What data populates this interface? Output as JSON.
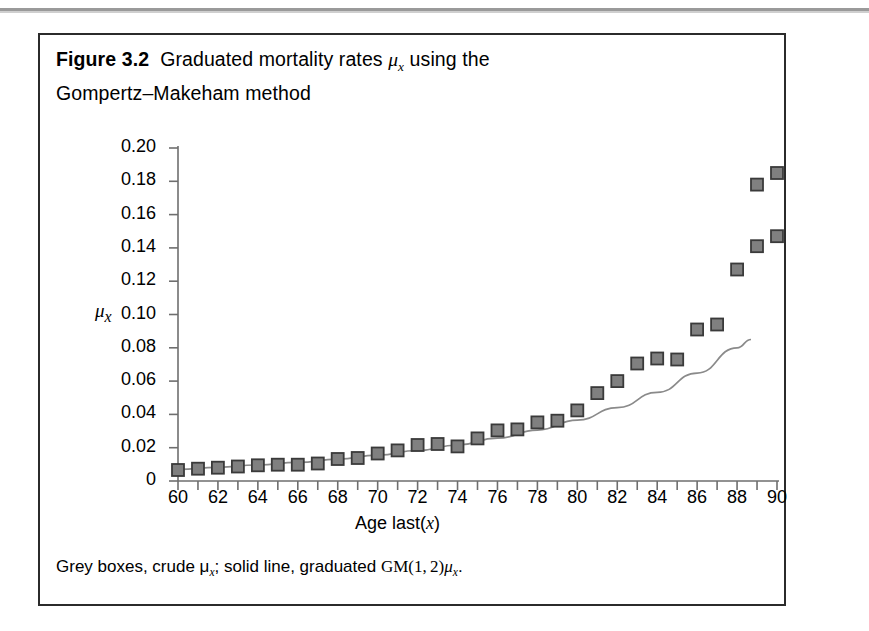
{
  "figure": {
    "number": "Figure 3.2",
    "title_line1": "Graduated mortality rates μ",
    "title_sub1": "x",
    "title_line1_tail": " using the",
    "title_line2": "Gompertz–Makeham method",
    "caption_pre": "Grey boxes, crude μ",
    "caption_sub1": "x",
    "caption_mid": "; solid line, graduated GM(1, 2)μ",
    "caption_sub2": "x",
    "caption_end": "."
  },
  "axes": {
    "ylabel": "μ",
    "ylabel_sub": "x",
    "xlabel_pre": "Age last(",
    "xlabel_var": "x",
    "xlabel_post": ")"
  },
  "colors": {
    "marker_fill": "#808080",
    "marker_edge": "#3a3a3a",
    "line": "#8a8a8a",
    "axis": "#6e6e6e",
    "frame": "#2b2b2b",
    "text": "#000000"
  },
  "chart_data": {
    "type": "scatter",
    "title": "Graduated mortality rates μx using the Gompertz–Makeham method",
    "xlabel": "Age last(x)",
    "ylabel": "μx",
    "xlim": [
      60,
      90
    ],
    "ylim": [
      0,
      0.2
    ],
    "xticks": [
      60,
      62,
      64,
      66,
      68,
      70,
      72,
      74,
      76,
      78,
      80,
      82,
      84,
      86,
      88,
      90
    ],
    "xtick_labels": [
      "60",
      "62",
      "64",
      "66",
      "68",
      "70",
      "72",
      "74",
      "76",
      "78",
      "80",
      "82",
      "84",
      "86",
      "88",
      "90"
    ],
    "xtick_minor_step": 1,
    "yticks": [
      0,
      0.02,
      0.04,
      0.06,
      0.08,
      0.1,
      0.12,
      0.14,
      0.16,
      0.18,
      0.2
    ],
    "ytick_labels": [
      "0",
      "0.02",
      "0.04",
      "0.06",
      "0.08",
      "0.10",
      "0.12",
      "0.14",
      "0.16",
      "0.18",
      "0.20"
    ],
    "grid": false,
    "legend": null,
    "series": [
      {
        "name": "Crude μx (grey boxes)",
        "marker": "square",
        "x": [
          60,
          61,
          62,
          63,
          64,
          65,
          66,
          67,
          68,
          69,
          70,
          71,
          72,
          73,
          74,
          75,
          76,
          77,
          78,
          79,
          80,
          81,
          82,
          83,
          84,
          85,
          86,
          87,
          88,
          89,
          90
        ],
        "values": [
          0.0066,
          0.0074,
          0.008,
          0.0087,
          0.0094,
          0.0098,
          0.0098,
          0.0105,
          0.0132,
          0.0138,
          0.0165,
          0.0184,
          0.0216,
          0.0222,
          0.0208,
          0.0256,
          0.0304,
          0.031,
          0.0352,
          0.0362,
          0.0424,
          0.0528,
          0.06,
          0.0706,
          0.0736,
          0.073,
          0.091,
          0.094,
          0.127,
          0.141,
          0.147
        ]
      },
      {
        "name": "Graduated GM(1,2) μx (solid line)",
        "type": "line",
        "x": [
          60,
          62,
          64,
          66,
          68,
          70,
          72,
          74,
          76,
          78,
          80,
          82,
          84,
          86,
          88,
          88.7
        ],
        "values": [
          0.007,
          0.0082,
          0.0096,
          0.0112,
          0.0131,
          0.0155,
          0.0183,
          0.0216,
          0.0257,
          0.0306,
          0.0366,
          0.044,
          0.0532,
          0.0648,
          0.08,
          0.085
        ]
      },
      {
        "name": "Crude μx upper extras",
        "type": "scatter-extra",
        "x": [
          89,
          90
        ],
        "values": [
          0.178,
          0.185
        ]
      }
    ]
  }
}
